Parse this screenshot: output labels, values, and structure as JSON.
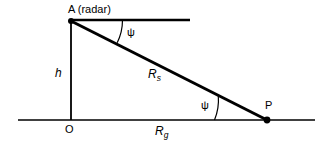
{
  "figure": {
    "kind": "geometry-diagram",
    "title_text": "",
    "background_color": "#ffffff",
    "stroke_color": "#000000",
    "labels": {
      "apex": "A (radar)",
      "origin": "O",
      "target": "P",
      "height": "h",
      "slant_range_base": "R",
      "slant_range_sub": "s",
      "ground_range_base": "R",
      "ground_range_sub": "g",
      "grazing_angle_top": "ψ",
      "grazing_angle_bottom": "ψ"
    },
    "points": {
      "A": {
        "x": 71,
        "y": 21,
        "name": "A (radar)"
      },
      "O": {
        "x": 71,
        "y": 120,
        "name": "O"
      },
      "P": {
        "x": 267,
        "y": 120,
        "name": "P"
      }
    },
    "segments": {
      "height_line": {
        "from": "A",
        "to": "O",
        "label": "h"
      },
      "slant_line": {
        "from": "A",
        "to": "P",
        "label": "Rs"
      },
      "ground_line": {
        "from": "O",
        "to": "P",
        "label": "Rg"
      },
      "horizontal_reference": {
        "from_x": 71,
        "to_x": 190,
        "y": 20
      }
    },
    "angles": [
      {
        "name": "grazing-angle-top",
        "vertex": "A",
        "symbol": "ψ"
      },
      {
        "name": "grazing-angle-bottom",
        "vertex": "P",
        "symbol": "ψ"
      }
    ]
  }
}
